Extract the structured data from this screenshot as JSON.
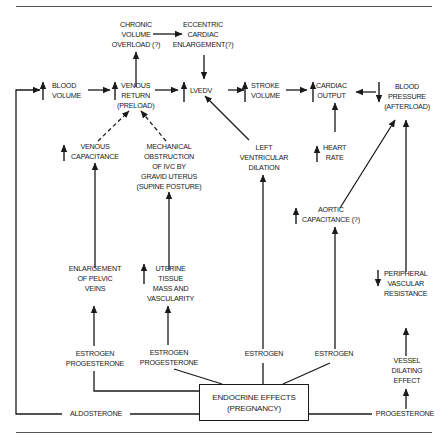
{
  "nodes": {
    "chronic_volume_overload": "CHRONIC\nVOLUME\nOVERLOAD (?)",
    "eccentric_cardiac_enlargement": "ECCENTRIC\nCARDIAC\nENLARGEMENT(?)",
    "blood_volume": "BLOOD\nVOLUME",
    "venous_return": "VENOUS\nRETURN\n(PRELOAD)",
    "lvedv": "LVEDV",
    "stroke_volume": "STROKE\nVOLUME",
    "cardiac_output": "CARDIAC\nOUTPUT",
    "blood_pressure": "BLOOD\nPRESSURE\n(AFTERLOAD)",
    "venous_capacitance": "VENOUS\nCAPACITANCE",
    "mechanical_obstruction": "MECHANICAL\nOBSTRUCTION\nOF IVC BY\nGRAVID UTERUS\n(SUPINE POSTURE)",
    "left_ventricular_dilation": "LEFT\nVENTRICULAR\nDILATION",
    "heart_rate": "HEART\nRATE",
    "aortic_capacitance": "AORTIC\nCAPACITANCE (?)",
    "enlargement_pelvic_veins": "ENLARGEMENT\nOF PELVIC\nVEINS",
    "uterine_tissue": "UTERINE\nTISSUE\nMASS AND\nVASCULARITY",
    "peripheral_vascular_resistance": "PERIPHERAL\nVASCULAR\nRESISTANCE",
    "estrogen_progesterone_1": "ESTROGEN\nPROGESTERONE",
    "estrogen_progesterone_2": "ESTROGEN\nPROGESTERONE",
    "estrogen_1": "ESTROGEN",
    "estrogen_2": "ESTROGEN",
    "vessel_dilating_effect": "VESSEL\nDILATING\nEFFECT",
    "endocrine_effects": "ENDOCRINE EFFECTS\n(PREGNANCY)",
    "aldosterone": "ALDOSTERONE",
    "progesterone": "PROGESTERONE"
  },
  "indicators": {
    "up": "increase",
    "down": "decrease"
  },
  "colors": {
    "ink": "#1a1a1a",
    "background": "#ffffff",
    "rule": "#555555"
  }
}
